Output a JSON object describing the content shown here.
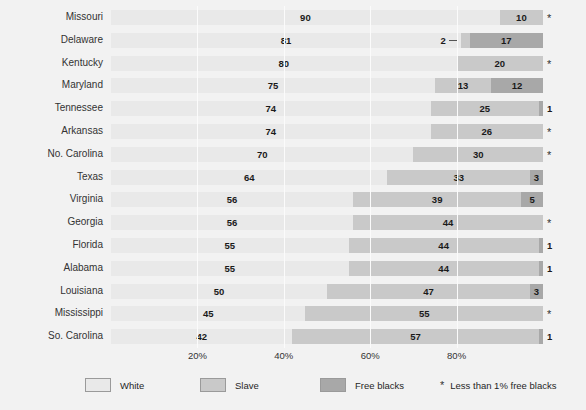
{
  "chart_data": {
    "type": "bar",
    "subtype": "stacked-horizontal-bar",
    "title": "",
    "xlabel": "",
    "ylabel": "",
    "xlim": [
      0,
      100
    ],
    "grid": true,
    "legend_position": "bottom",
    "categories": [
      "Missouri",
      "Delaware",
      "Kentucky",
      "Maryland",
      "Tennessee",
      "Arkansas",
      "No. Carolina",
      "Texas",
      "Virginia",
      "Georgia",
      "Florida",
      "Alabama",
      "Louisiana",
      "Mississippi",
      "So. Carolina"
    ],
    "series": [
      {
        "name": "White",
        "color": "#e9e9e9",
        "values": [
          90,
          81,
          80,
          75,
          74,
          74,
          70,
          64,
          56,
          56,
          55,
          55,
          50,
          45,
          42
        ]
      },
      {
        "name": "Slave",
        "color": "#c9c9c9",
        "values": [
          10,
          2,
          20,
          13,
          25,
          26,
          30,
          33,
          39,
          44,
          44,
          44,
          47,
          55,
          57
        ]
      },
      {
        "name": "Free blacks",
        "color": "#a8a8a8",
        "values": [
          0,
          17,
          0,
          12,
          1,
          0,
          0,
          3,
          5,
          0,
          1,
          1,
          3,
          0,
          1
        ]
      }
    ],
    "value_labels": {
      "white": [
        "90",
        "81",
        "80",
        "75",
        "74",
        "74",
        "70",
        "64",
        "56",
        "56",
        "55",
        "55",
        "50",
        "45",
        "42"
      ],
      "slave": [
        "10",
        "2",
        "20",
        "13",
        "25",
        "26",
        "30",
        "33",
        "39",
        "44",
        "44",
        "44",
        "47",
        "55",
        "57"
      ],
      "free": [
        "*",
        "17",
        "*",
        "12",
        "1",
        "*",
        "*",
        "3",
        "5",
        "*",
        "1",
        "1",
        "3",
        "*",
        "1"
      ]
    },
    "xticks": [
      20,
      40,
      60,
      80
    ],
    "xtick_labels": [
      "20%",
      "40%",
      "60%",
      "80%"
    ],
    "annotation_note": "* Less than 1% free blacks"
  },
  "legend": {
    "items": [
      {
        "label": "White",
        "color": "#e9e9e9"
      },
      {
        "label": "Slave",
        "color": "#c9c9c9"
      },
      {
        "label": "Free blacks",
        "color": "#a8a8a8"
      }
    ],
    "star_glyph": "*",
    "note": "Less than 1% free blacks"
  }
}
